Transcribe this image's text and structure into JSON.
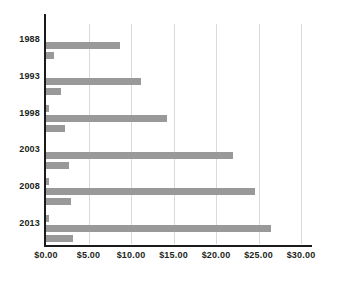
{
  "chart_data": {
    "type": "bar",
    "orientation": "horizontal",
    "grouped": true,
    "title": "",
    "subtitle": "",
    "xlabel": "",
    "ylabel": "",
    "categories": [
      "1988",
      "1993",
      "1998",
      "2003",
      "2008",
      "2013"
    ],
    "series": [
      {
        "name": "series-1",
        "values": [
          0.0,
          0.0,
          0.35,
          0.0,
          0.35,
          0.35
        ]
      },
      {
        "name": "series-2",
        "values": [
          8.7,
          11.2,
          14.2,
          22.0,
          24.6,
          26.5
        ]
      },
      {
        "name": "series-3",
        "values": [
          0.9,
          1.8,
          2.2,
          2.7,
          2.9,
          3.2
        ]
      }
    ],
    "xlim": [
      0,
      30
    ],
    "xticks": [
      0,
      5,
      10,
      15,
      20,
      25,
      30
    ],
    "xtick_labels": [
      "$0.00",
      "$5.00",
      "$10.00",
      "$15.00",
      "$20.00",
      "$25.00",
      "$30.00"
    ],
    "grid": true,
    "grid_axis": "x",
    "legend": false,
    "legend_position": "none",
    "colors": {
      "bar": "#999999",
      "grid": "#d9d9d9",
      "axis": "#1a1a1a",
      "text": "#231f20",
      "background": "#ffffff"
    }
  }
}
